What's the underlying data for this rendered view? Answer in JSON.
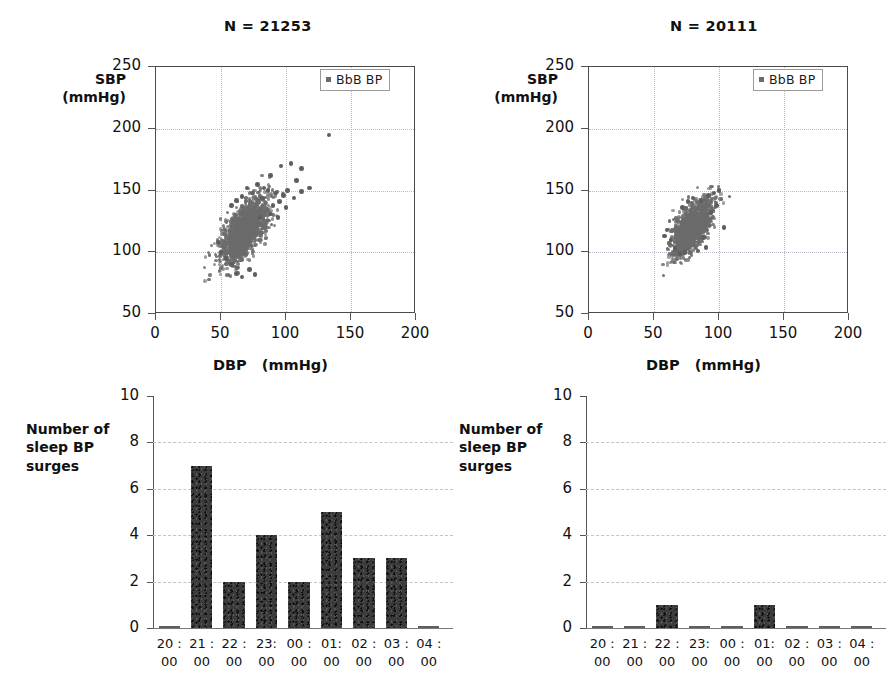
{
  "figure": {
    "background": "#ffffff",
    "point_color": "#6b6b6b",
    "bar_color": "#3b3b3b",
    "grid_color": "#b9b9c6"
  },
  "legend": {
    "label": "BbB BP",
    "marker": "square-marker"
  },
  "chart_data": [
    {
      "id": "scatter-left",
      "type": "scatter",
      "title": "N = 21253",
      "xlabel": "DBP   (mmHg)",
      "ylabel": "SBP\n(mmHg)",
      "xlim": [
        0,
        200
      ],
      "ylim": [
        50,
        250
      ],
      "xticks": [
        0,
        50,
        100,
        150,
        200
      ],
      "yticks": [
        50,
        100,
        150,
        200,
        250
      ],
      "grid": true,
      "legend": [
        "BbB BP"
      ],
      "legend_position": "top-right",
      "n_points": 21253,
      "cluster": {
        "x_center": 68,
        "y_center": 118,
        "x_spread": 9,
        "y_spread": 13,
        "correlation": 0.62,
        "n_dense": 1500
      },
      "outliers": [
        [
          133,
          195
        ],
        [
          112,
          168
        ],
        [
          104,
          172
        ],
        [
          96,
          170
        ],
        [
          88,
          162
        ],
        [
          108,
          158
        ],
        [
          118,
          152
        ],
        [
          112,
          149
        ],
        [
          101,
          150
        ],
        [
          98,
          146
        ],
        [
          92,
          148
        ],
        [
          95,
          141
        ],
        [
          86,
          150
        ],
        [
          83,
          152
        ],
        [
          90,
          138
        ],
        [
          78,
          155
        ],
        [
          82,
          144
        ],
        [
          74,
          148
        ],
        [
          100,
          136
        ],
        [
          106,
          144
        ],
        [
          70,
          152
        ],
        [
          66,
          145
        ],
        [
          62,
          142
        ],
        [
          58,
          138
        ],
        [
          88,
          131
        ],
        [
          94,
          128
        ],
        [
          58,
          90
        ],
        [
          62,
          83
        ],
        [
          66,
          80
        ],
        [
          72,
          86
        ],
        [
          54,
          95
        ],
        [
          50,
          100
        ],
        [
          48,
          108
        ],
        [
          76,
          82
        ],
        [
          80,
          128
        ]
      ]
    },
    {
      "id": "scatter-right",
      "type": "scatter",
      "title": "N = 20111",
      "xlabel": "DBP   (mmHg)",
      "ylabel": "SBP\n(mmHg)",
      "xlim": [
        0,
        200
      ],
      "ylim": [
        50,
        250
      ],
      "xticks": [
        0,
        50,
        100,
        150,
        200
      ],
      "yticks": [
        50,
        100,
        150,
        200,
        250
      ],
      "grid": true,
      "legend": [
        "BbB BP"
      ],
      "legend_position": "top-right",
      "n_points": 20111,
      "cluster": {
        "x_center": 79,
        "y_center": 120,
        "x_spread": 7.5,
        "y_spread": 11,
        "correlation": 0.66,
        "n_dense": 1400
      },
      "outliers": [
        [
          96,
          148
        ],
        [
          100,
          150
        ],
        [
          92,
          146
        ],
        [
          104,
          120
        ],
        [
          60,
          118
        ],
        [
          66,
          103
        ],
        [
          74,
          100
        ],
        [
          84,
          101
        ],
        [
          70,
          99
        ],
        [
          88,
          112
        ],
        [
          90,
          104
        ],
        [
          63,
          110
        ],
        [
          58,
          113
        ],
        [
          94,
          132
        ],
        [
          98,
          138
        ],
        [
          86,
          142
        ],
        [
          80,
          144
        ],
        [
          76,
          141
        ],
        [
          72,
          136
        ]
      ]
    },
    {
      "id": "bars-left",
      "type": "bar",
      "title": "",
      "ylabel": "Number of\nsleep BP\nsurges",
      "xlabel": "",
      "categories": [
        "20 :\n00",
        "21 :\n00",
        "22 :\n00",
        "23:\n00",
        "00 :\n00",
        "01:\n00",
        "02 :\n00",
        "03 :\n00",
        "04 :\n00"
      ],
      "values": [
        0,
        7,
        2,
        4,
        2,
        5,
        3,
        3,
        0
      ],
      "yticks": [
        0,
        2,
        4,
        6,
        8,
        10
      ],
      "ylim": [
        0,
        10
      ],
      "grid": true
    },
    {
      "id": "bars-right",
      "type": "bar",
      "title": "",
      "ylabel": "Number of\nsleep BP\nsurges",
      "xlabel": "",
      "categories": [
        "20 :\n00",
        "21 :\n00",
        "22 :\n00",
        "23:\n00",
        "00 :\n00",
        "01:\n00",
        "02 :\n00",
        "03 :\n00",
        "04 :\n00"
      ],
      "values": [
        0,
        0,
        1,
        0,
        0,
        1,
        0,
        0,
        0
      ],
      "yticks": [
        0,
        2,
        4,
        6,
        8,
        10
      ],
      "ylim": [
        0,
        10
      ],
      "grid": true
    }
  ]
}
